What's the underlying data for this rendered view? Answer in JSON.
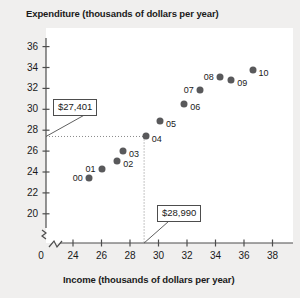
{
  "chart_data": {
    "type": "scatter",
    "title": "",
    "xlabel": "Income (thousands of dollars per year)",
    "ylabel": "Expenditure (thousands of dollars per year)",
    "xlim": [
      22.6,
      38.8
    ],
    "ylim": [
      19.0,
      36.8
    ],
    "xticks": [
      24,
      26,
      28,
      30,
      32,
      34,
      36,
      38
    ],
    "yticks": [
      20,
      22,
      24,
      26,
      28,
      30,
      32,
      34,
      36
    ],
    "axis_break_x": true,
    "axis_break_y": true,
    "origin_label": "0",
    "grid": false,
    "legend": null,
    "point_color": "#59595b",
    "points": [
      {
        "label": "00",
        "x": 25.1,
        "y": 23.4,
        "label_side": "left"
      },
      {
        "label": "01",
        "x": 26.0,
        "y": 24.3,
        "label_side": "left"
      },
      {
        "label": "02",
        "x": 27.1,
        "y": 25.1,
        "label_side": "right"
      },
      {
        "label": "03",
        "x": 27.5,
        "y": 26.0,
        "label_side": "right"
      },
      {
        "label": "04",
        "x": 29.1,
        "y": 27.4,
        "label_side": "right"
      },
      {
        "label": "05",
        "x": 30.1,
        "y": 28.9,
        "label_side": "right"
      },
      {
        "label": "06",
        "x": 31.8,
        "y": 30.5,
        "label_side": "right"
      },
      {
        "label": "07",
        "x": 32.9,
        "y": 31.8,
        "label_side": "left"
      },
      {
        "label": "08",
        "x": 34.3,
        "y": 33.1,
        "label_side": "left"
      },
      {
        "label": "09",
        "x": 35.1,
        "y": 32.8,
        "label_side": "right"
      },
      {
        "label": "10",
        "x": 36.6,
        "y": 33.8,
        "label_side": "right"
      }
    ],
    "annotations": [
      {
        "name": "expenditure-callout",
        "text": "$27,401",
        "points_to_axis": "y",
        "value": 27.4
      },
      {
        "name": "income-callout",
        "text": "$28,990",
        "points_to_axis": "x",
        "value": 28.99
      }
    ],
    "guide_lines": [
      {
        "name": "horizontal-guide",
        "axis": "y",
        "value": 27.4
      },
      {
        "name": "vertical-guide",
        "axis": "x",
        "value": 28.99
      }
    ]
  }
}
